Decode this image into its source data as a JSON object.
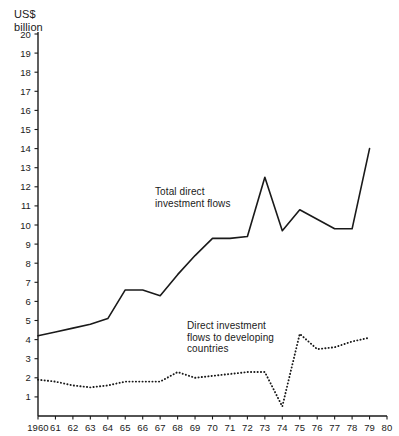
{
  "chart_data": {
    "type": "line",
    "title": "",
    "ylabel": "US$\nbillion",
    "xlabel": "",
    "ylim": [
      0,
      20
    ],
    "xlim": [
      1960,
      1980
    ],
    "grid": false,
    "legend_position": "inline-annotation",
    "ytick_labels": [
      "20",
      "19",
      "18",
      "17",
      "16",
      "15",
      "14",
      "13",
      "12",
      "11",
      "10",
      "9",
      "8",
      "7",
      "6",
      "5",
      "4",
      "3",
      "2",
      "1"
    ],
    "ytick_values": [
      20,
      19,
      18,
      17,
      16,
      15,
      14,
      13,
      12,
      11,
      10,
      9,
      8,
      7,
      6,
      5,
      4,
      3,
      2,
      1
    ],
    "xtick_labels": [
      "1960",
      "61",
      "62",
      "63",
      "64",
      "65",
      "66",
      "67",
      "68",
      "69",
      "70",
      "71",
      "72",
      "73",
      "74",
      "75",
      "76",
      "77",
      "78",
      "79",
      "80"
    ],
    "x": [
      1960,
      1961,
      1962,
      1963,
      1964,
      1965,
      1966,
      1967,
      1968,
      1969,
      1970,
      1971,
      1972,
      1973,
      1974,
      1975,
      1976,
      1977,
      1978,
      1979
    ],
    "series": [
      {
        "name": "Total direct investment flows",
        "style": "solid",
        "color": "#1a1a1a",
        "annotation": "Total direct\ninvestment flows",
        "values": [
          4.2,
          4.4,
          4.6,
          4.8,
          5.1,
          6.6,
          6.6,
          6.3,
          7.4,
          8.4,
          9.3,
          9.3,
          9.4,
          12.5,
          9.7,
          10.8,
          10.3,
          9.8,
          9.8,
          14.0
        ]
      },
      {
        "name": "Direct investment flows to developing countries",
        "style": "dotted",
        "color": "#1a1a1a",
        "annotation": "Direct investment\nflows to developing\ncountries",
        "values": [
          1.9,
          1.8,
          1.6,
          1.5,
          1.6,
          1.8,
          1.8,
          1.8,
          2.3,
          2.0,
          2.1,
          2.2,
          2.3,
          2.3,
          0.5,
          4.3,
          3.5,
          3.6,
          3.9,
          4.1
        ]
      }
    ]
  },
  "plot_geometry": {
    "left": 38,
    "right": 387,
    "baseline_y": 416,
    "top_y": 34,
    "value_per_pixel_note": "y=0 at 416, y=20 at 34"
  }
}
